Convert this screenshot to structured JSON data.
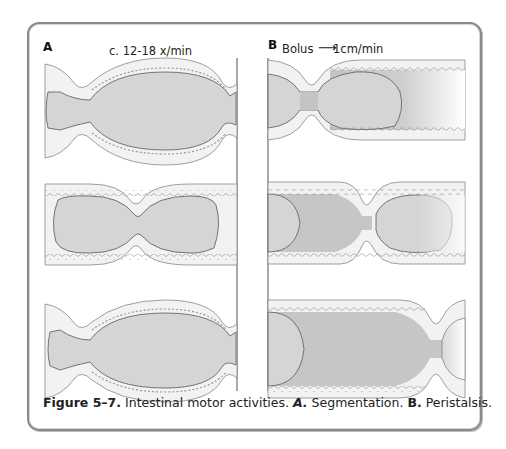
{
  "figure": {
    "panel_a": {
      "label": "A",
      "annotation": "c. 12-18 x/min",
      "title": "Segmentation"
    },
    "panel_b": {
      "label": "B",
      "annotation_left": "Bolus",
      "arrow": "⟶",
      "annotation_right": "1cm/min",
      "title": "Peristalsis"
    },
    "caption": {
      "number": "Figure 5–7.",
      "text": " Intestinal motor activities. ",
      "a_label": "A.",
      "a_text": " Segmentation. ",
      "b_label": "B.",
      "b_text": " Peristalsis."
    },
    "colors": {
      "frame": "#8a8a8a",
      "wall_fill": "#f1f1f1",
      "lumen_fill": "#d6d6d6",
      "contraction_fill": "#c4c4c4",
      "outline": "#777777"
    }
  }
}
